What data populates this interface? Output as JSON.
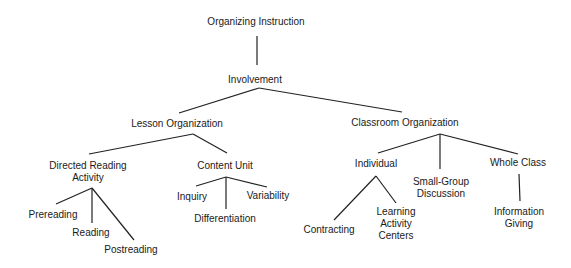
{
  "diagram": {
    "type": "hierarchy-tree",
    "root": {
      "label": "Organizing Instruction",
      "children": [
        {
          "label": "Involvement",
          "children": [
            {
              "label": "Lesson Organization",
              "children": [
                {
                  "label": "Directed Reading Activity",
                  "children": [
                    {
                      "label": "Prereading"
                    },
                    {
                      "label": "Reading"
                    },
                    {
                      "label": "Postreading"
                    }
                  ]
                },
                {
                  "label": "Content Unit",
                  "children": [
                    {
                      "label": "Inquiry"
                    },
                    {
                      "label": "Differentiation"
                    },
                    {
                      "label": "Variability"
                    }
                  ]
                }
              ]
            },
            {
              "label": "Classroom Organization",
              "children": [
                {
                  "label": "Individual",
                  "children": [
                    {
                      "label": "Contracting"
                    },
                    {
                      "label": "Learning Activity Centers"
                    }
                  ]
                },
                {
                  "label": "Small-Group Discussion"
                },
                {
                  "label": "Whole Class",
                  "children": [
                    {
                      "label": "Information Giving"
                    }
                  ]
                }
              ]
            }
          ]
        }
      ]
    }
  },
  "nodes": {
    "organizing_instruction": "Organizing Instruction",
    "involvement": "Involvement",
    "lesson_organization": "Lesson Organization",
    "classroom_organization": "Classroom Organization",
    "directed_reading_line1": "Directed Reading",
    "directed_reading_line2": "Activity",
    "content_unit": "Content Unit",
    "prereading": "Prereading",
    "reading": "Reading",
    "postreading": "Postreading",
    "inquiry": "Inquiry",
    "differentiation": "Differentiation",
    "variability": "Variability",
    "individual": "Individual",
    "small_group_line1": "Small-Group",
    "small_group_line2": "Discussion",
    "whole_class": "Whole Class",
    "contracting": "Contracting",
    "learning_centers_line1": "Learning",
    "learning_centers_line2": "Activity",
    "learning_centers_line3": "Centers",
    "information_giving_line1": "Information",
    "information_giving_line2": "Giving"
  },
  "colors": {
    "line": "#222222",
    "text": "#1a1a1a",
    "background": "#ffffff"
  }
}
